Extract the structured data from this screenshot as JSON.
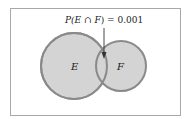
{
  "diagram": {
    "type": "venn",
    "annotation": "P(E ∩ F) = 0.001",
    "annotation_parts": {
      "p": "P(",
      "e": "E",
      "cap": " ∩ ",
      "f": "F",
      "rest": ") = 0.001"
    },
    "sets": [
      {
        "name": "E",
        "label": "E"
      },
      {
        "name": "F",
        "label": "F"
      }
    ],
    "intersection_probability": "0.001",
    "colors": {
      "fill": "#d4d4d4",
      "stroke": "#8a8a8a",
      "border": "#a8a8a8",
      "arrow": "#333333"
    }
  }
}
